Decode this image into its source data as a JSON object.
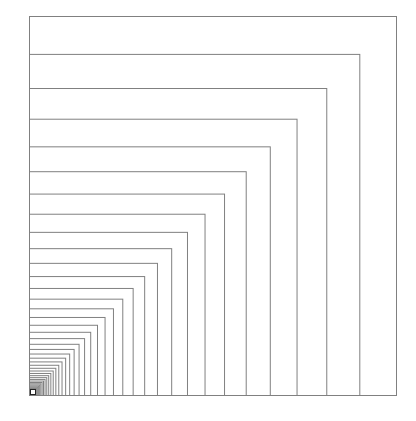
{
  "diagram": {
    "type": "nested-rectangles",
    "anchor": "bottom-left",
    "origin_x": 29,
    "origin_y": 395,
    "outer_width": 367,
    "outer_height": 379,
    "scale_ratio": 0.9,
    "count": 42,
    "stroke_color": "#808080",
    "stroke_width": 1,
    "background": "#ffffff",
    "corner_marker": {
      "size": 5,
      "fill": "#ffffff",
      "stroke": "#222222"
    }
  }
}
